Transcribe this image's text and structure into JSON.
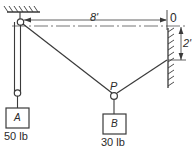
{
  "figure": {
    "stroke_color": "#3a3a3a",
    "labels": {
      "span_dimension": "8'",
      "height_dimension": "2'",
      "origin": "0",
      "joint_point": "P",
      "block_a_name": "A",
      "block_a_weight": "50 lb",
      "block_b_name": "B",
      "block_b_weight": "30 lb"
    },
    "supports": {
      "ceiling": "hatched-ceiling",
      "wall": "hatched-wall"
    },
    "members": [
      {
        "name": "left-vertical-cable",
        "from": "ceiling-pulley",
        "to": "block-a"
      },
      {
        "name": "cable-pulley-to-p",
        "from": "ceiling-pulley",
        "to": "joint-p"
      },
      {
        "name": "cable-p-to-wall",
        "from": "joint-p",
        "to": "wall-anchor"
      },
      {
        "name": "cable-p-to-block-b",
        "from": "joint-p",
        "to": "block-b"
      }
    ]
  }
}
